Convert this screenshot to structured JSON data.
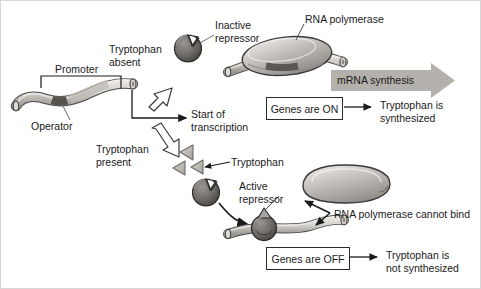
{
  "diagram": {
    "background_color": "#ffffff",
    "labels": {
      "promoter": "Promoter",
      "operator": "Operator",
      "tryptophan_absent_line1": "Tryptophan",
      "tryptophan_absent_line2": "absent",
      "tryptophan_present_line1": "Tryptophan",
      "tryptophan_present_line2": "present",
      "inactive_repressor_line1": "Inactive",
      "inactive_repressor_line2": "repressor",
      "active_repressor_line1": "Active",
      "active_repressor_line2": "repressor",
      "rna_polymerase": "RNA polymerase",
      "rna_polymerase_cannot_bind": "RNA polymerase cannot bind",
      "start_of_transcription_line1": "Start of",
      "start_of_transcription_line2": "transcription",
      "tryptophan_molecule": "Tryptophan",
      "mrna_synthesis": "mRNA synthesis",
      "genes_are_on": "Genes are ON",
      "genes_are_off": "Genes are OFF",
      "tryptophan_is_line1": "Tryptophan is",
      "tryptophan_is_synthesized": "synthesized",
      "tryptophan_is_not_synthesized": "not synthesized"
    },
    "colors": {
      "dna_fill": "#c9c6c0",
      "dna_stroke": "#4a4a4a",
      "operator_dark": "#5b5751",
      "repressor_fill": "#6e6a66",
      "repressor_stroke": "#2e2c2a",
      "polymerase_fill": "#b9b6b1",
      "polymerase_stroke": "#3c3a38",
      "tryptophan_fill": "#b5b2ad",
      "mrna_arrow_fill": "#b4b1ac",
      "text": "#1a1a1a",
      "outline": "#2b2b2b"
    }
  }
}
